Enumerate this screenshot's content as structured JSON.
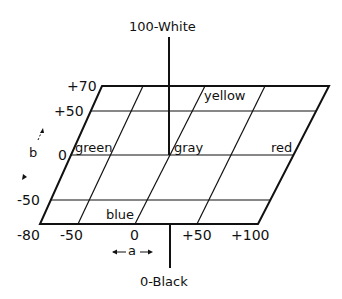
{
  "diagram": {
    "vertical_axis": {
      "top_label": "100-White",
      "bottom_label": "0-Black"
    },
    "a_axis": {
      "label": "a",
      "ticks": [
        "-80",
        "-50",
        "0",
        "+50",
        "+100"
      ]
    },
    "b_axis": {
      "label": "b",
      "ticks": [
        "+70",
        "+50",
        "0",
        "-50"
      ]
    },
    "color_labels": {
      "yellow": "yellow",
      "green": "green",
      "gray": "gray",
      "red": "red",
      "blue": "blue"
    },
    "line_color": "#111111",
    "background": "#ffffff"
  }
}
